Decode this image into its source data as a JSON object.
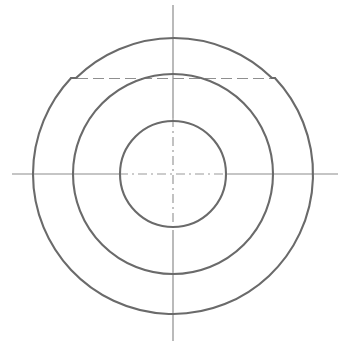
{
  "drawing": {
    "title": "Concentric circular part - front view",
    "canvas": {
      "width": 351,
      "height": 363,
      "background_color": "#ffffff"
    },
    "colors": {
      "outline_stroke": "#6a6a6a",
      "centerline_stroke": "#8c8c8c",
      "centerline_dash_stroke": "#9a9a9a"
    },
    "center": {
      "x": 173,
      "y": 174
    },
    "circles": [
      {
        "name": "outer-circle",
        "radius": 140,
        "stroke_width": 2.1
      },
      {
        "name": "middle-circle",
        "radius": 100,
        "stroke_width": 2.1
      },
      {
        "name": "inner-circle",
        "radius": 53,
        "stroke_width": 2.1
      }
    ],
    "notches": [
      {
        "name": "notch-left",
        "side": "left",
        "y": 78,
        "start_x": 66,
        "end_x": 76,
        "path": "M 39.5 126.5 L 66.5 78.5 L 76.5 78.5 L 81 72.5"
      },
      {
        "name": "notch-right",
        "side": "right",
        "y": 78,
        "start_x": 272,
        "end_x": 282,
        "path": "M 265 72.5 L 271.5 78.5 L 281.5 78.5 L 307 126.5"
      }
    ],
    "centerlines": [
      {
        "name": "vertical-centerline",
        "orientation": "vertical",
        "x": 173,
        "y_start": 5,
        "y_end": 341
      },
      {
        "name": "horizontal-centerline",
        "orientation": "horizontal",
        "y": 174,
        "x_start": 12,
        "x_end": 338
      },
      {
        "name": "notch-reference-line",
        "orientation": "horizontal",
        "style": "dashed",
        "y": 78,
        "x_start": 77,
        "x_end": 271
      }
    ]
  }
}
